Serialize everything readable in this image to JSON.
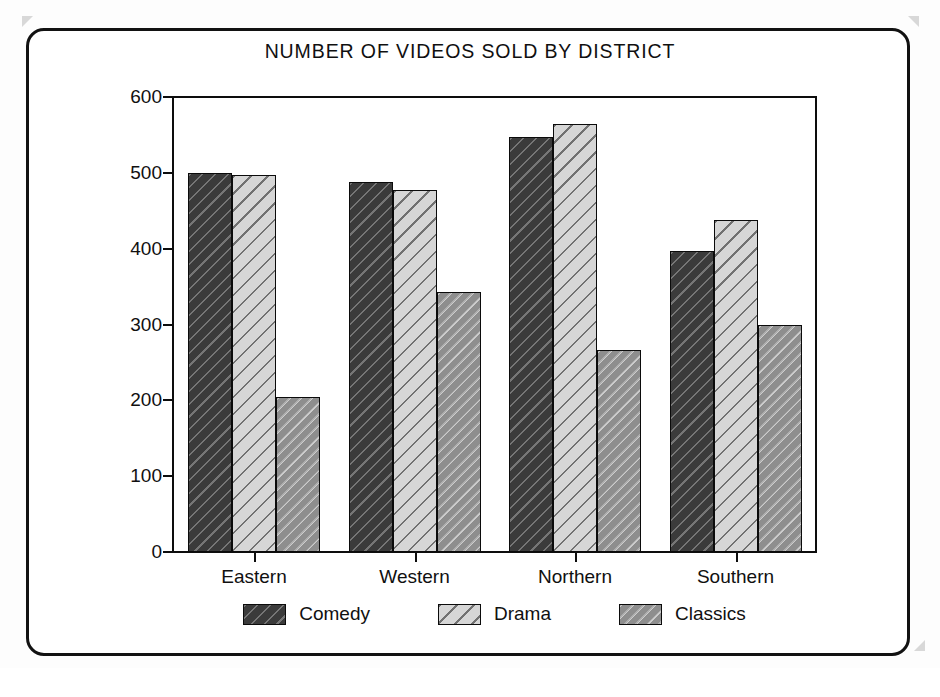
{
  "chart_data": {
    "type": "bar",
    "title": "NUMBER OF VIDEOS SOLD BY DISTRICT",
    "xlabel": "",
    "ylabel": "",
    "ylim": [
      0,
      600
    ],
    "yticks": [
      0,
      100,
      200,
      300,
      400,
      500,
      600
    ],
    "ytick_labels": [
      "0",
      "100",
      "200",
      "300",
      "400",
      "500",
      "600"
    ],
    "grid": false,
    "legend_position": "bottom",
    "categories": [
      "Eastern",
      "Western",
      "Northern",
      "Southern"
    ],
    "series": [
      {
        "name": "Comedy",
        "color": "#3b3b3b",
        "pattern": "diagonal-hatch-dark",
        "values": [
          500,
          488,
          547,
          397
        ]
      },
      {
        "name": "Drama",
        "color": "#d6d6d6",
        "pattern": "diagonal-hatch-light",
        "values": [
          497,
          478,
          565,
          438
        ]
      },
      {
        "name": "Classics",
        "color": "#8e8e8e",
        "pattern": "diagonal-hatch-medium",
        "values": [
          205,
          343,
          267,
          299
        ]
      }
    ]
  },
  "legend": {
    "items": [
      {
        "label": "Comedy"
      },
      {
        "label": "Drama"
      },
      {
        "label": "Classics"
      }
    ]
  }
}
